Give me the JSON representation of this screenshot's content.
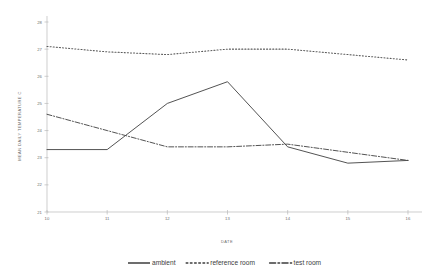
{
  "chart_data": {
    "type": "line",
    "title": "",
    "xlabel": "DATE",
    "ylabel": "MEAN DAILY TEMPERATURE C",
    "x": [
      "10",
      "11",
      "12",
      "13",
      "14",
      "15",
      "16"
    ],
    "xlim": [
      0,
      6
    ],
    "ylim": [
      21,
      28
    ],
    "yticks": [
      21,
      22,
      23,
      24,
      25,
      26,
      27,
      28
    ],
    "ytick_labels": [
      "21",
      "22",
      "23",
      "24",
      "25",
      "26",
      "27",
      "28"
    ],
    "grid": false,
    "legend_position": "bottom",
    "series": [
      {
        "name": "ambient",
        "style": "solid",
        "color": "#4a4a4a",
        "values": [
          23.3,
          23.3,
          25.0,
          25.8,
          23.4,
          22.8,
          22.9
        ]
      },
      {
        "name": "reference room",
        "style": "dotted",
        "color": "#5a5a5a",
        "values": [
          27.1,
          26.9,
          26.8,
          27.0,
          27.0,
          26.8,
          26.6
        ]
      },
      {
        "name": "test room",
        "style": "dashdot",
        "color": "#4a4a4a",
        "values": [
          24.6,
          24.0,
          23.4,
          23.4,
          23.5,
          23.2,
          22.9
        ]
      }
    ]
  },
  "legend": {
    "items": [
      {
        "label": "ambient",
        "style": "solid"
      },
      {
        "label": "reference room",
        "style": "dotted"
      },
      {
        "label": "test room",
        "style": "dashdot"
      }
    ]
  }
}
